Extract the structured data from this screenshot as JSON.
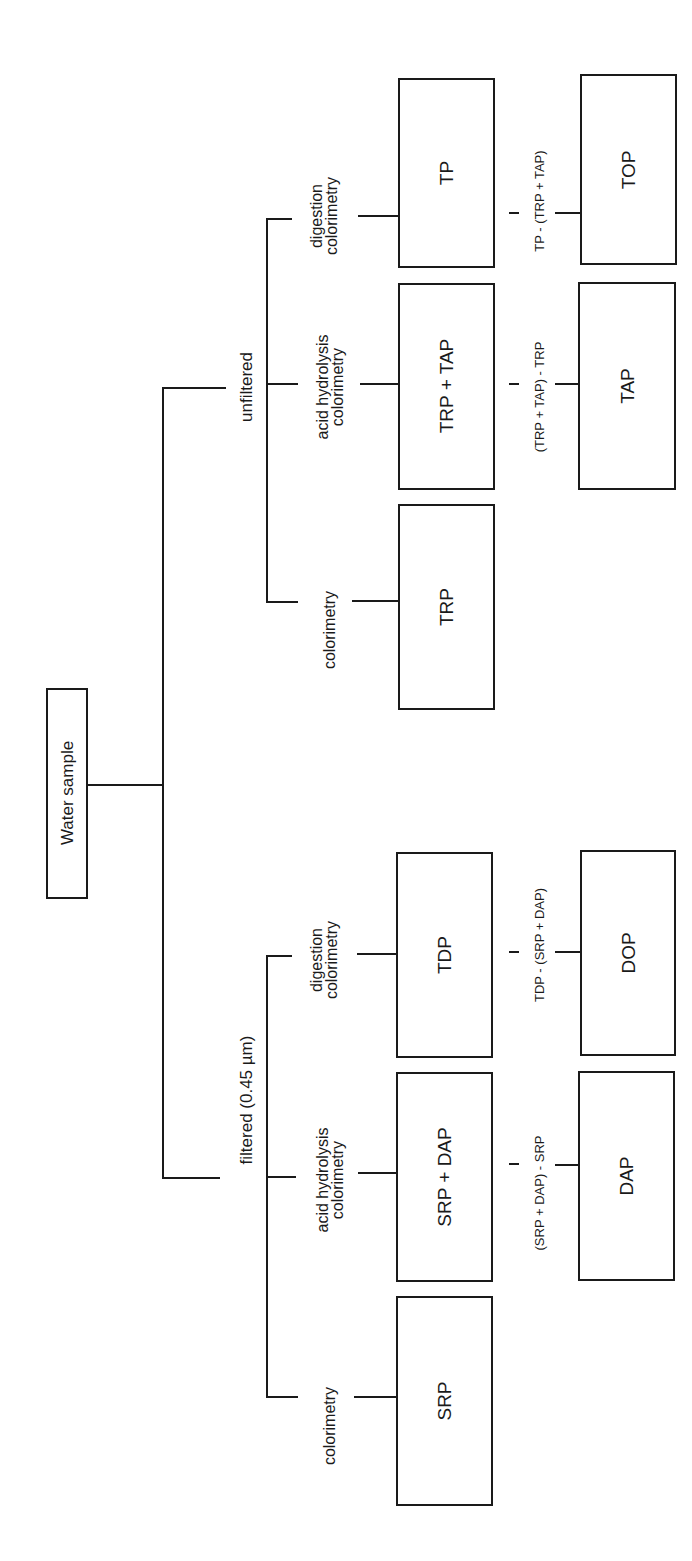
{
  "diagram": {
    "orientation": "rotated-90-ccw",
    "root": {
      "label": "Water sample"
    },
    "branches": [
      {
        "label": "unfiltered",
        "methods": [
          {
            "method": "colorimetry",
            "measured": "TRP"
          },
          {
            "method": "acid hydrolysis\ncolorimetry",
            "method_line1": "acid hydrolysis",
            "method_line2": "colorimetry",
            "measured": "TRP + TAP",
            "formula": "(TRP + TAP) - TRP",
            "derived": "TAP"
          },
          {
            "method": "digestion\ncolorimetry",
            "method_line1": "digestion",
            "method_line2": "colorimetry",
            "measured": "TP",
            "formula": "TP - (TRP + TAP)",
            "derived": "TOP"
          }
        ]
      },
      {
        "label": "filtered (0.45 µm)",
        "methods": [
          {
            "method": "colorimetry",
            "measured": "SRP"
          },
          {
            "method": "acid hydrolysis\ncolorimetry",
            "method_line1": "acid hydrolysis",
            "method_line2": "colorimetry",
            "measured": "SRP + DAP",
            "formula": "(SRP + DAP) - SRP",
            "derived": "DAP"
          },
          {
            "method": "digestion\ncolorimetry",
            "method_line1": "digestion",
            "method_line2": "colorimetry",
            "measured": "TDP",
            "formula": "TDP - (SRP + DAP)",
            "derived": "DOP"
          }
        ]
      }
    ],
    "colors": {
      "line": "#1a1a1a",
      "background": "#ffffff"
    }
  }
}
